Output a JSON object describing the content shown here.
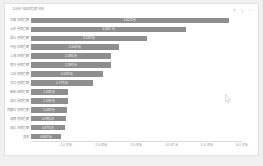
{
  "card": {
    "title": "各省市地区销售额排名",
    "toolbar": [
      {
        "name": "filter-icon",
        "label": "筛选"
      },
      {
        "name": "download-icon",
        "label": "下载"
      },
      {
        "name": "more-icon",
        "label": "更多"
      }
    ]
  },
  "colors": {
    "bar": "#8e8e8e",
    "card_bg": "#ffffff",
    "page_bg": "#f0f0f0",
    "border": "#e2e2e2",
    "axis": "#dcdcdc",
    "label_text": "#8c8c8c",
    "value_text": "#ffffff",
    "title_text": "#9a9a9a"
  },
  "chart_data": {
    "type": "bar",
    "orientation": "horizontal",
    "title": "各省市地区销售额排名",
    "xlabel": "",
    "ylabel": "",
    "xlim": [
      0,
      6.0
    ],
    "xunit": "亿元",
    "grid": false,
    "legend": null,
    "categories": [
      "巴黎市销售额",
      "山东省销售额",
      "浙江省销售额",
      "中国市销售额",
      "上海市销售额",
      "南方省销售额",
      "江苏省销售额",
      "河北省销售额",
      "新区域销售额",
      "湖北省销售额",
      "内蒙古省销售额",
      "湖南省销售额",
      "湖北市销售额",
      "其他"
    ],
    "values": [
      5.62,
      4.41,
      3.31,
      2.5,
      2.28,
      2.28,
      2.05,
      1.77,
      1.05,
      1.05,
      1.03,
      0.99,
      0.97,
      0.86
    ],
    "value_labels": [
      "5.62亿元",
      "4.41亿元",
      "3.31亿元",
      "2.50亿元",
      "2.28亿元",
      "2.28亿元",
      "2.05亿元",
      "1.77亿元",
      "1.05亿元",
      "1.05亿元",
      "1.03亿元",
      "0.99亿元",
      "0.97亿元",
      "0.86亿元"
    ],
    "xticks": [
      1.0,
      2.0,
      3.0,
      4.0,
      5.0,
      6.0
    ],
    "xticklabels": [
      "1.0 亿元",
      "2.0 亿元",
      "3.0 亿元",
      "4.0 亿元",
      "5.0 亿元",
      "6.0 亿元"
    ]
  }
}
